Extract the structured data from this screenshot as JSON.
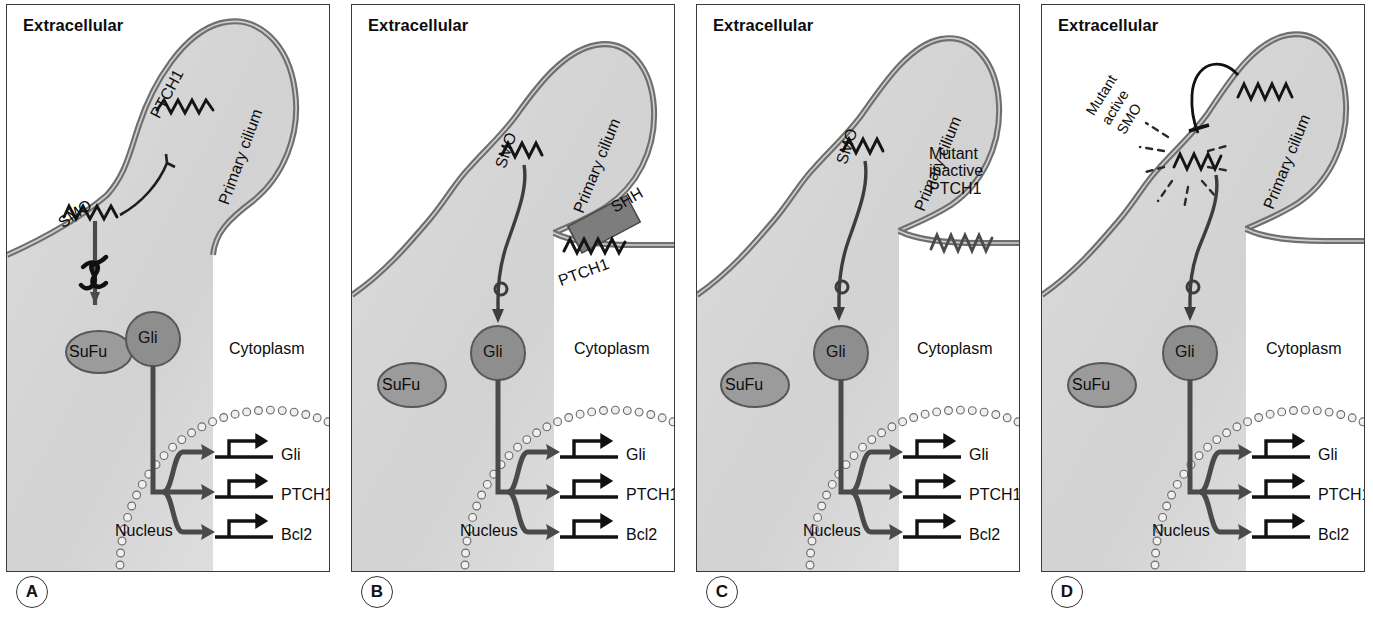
{
  "figure": {
    "colors": {
      "membrane": "#6f6f6f",
      "cytoplasm": "#d2d2d2",
      "nucleus_dark": "#8f8f8f",
      "gli_fill": "#8e8e8e",
      "sufu_fill": "#9b9b9b",
      "shh_fill": "#7d7d7d",
      "line": "#2b2b2b",
      "panel_border": "#3a3a3a"
    }
  },
  "panels": [
    {
      "letter": "A",
      "state": "inactive-pathway",
      "extracellular": "Extracellular",
      "cytoplasm": "Cytoplasm",
      "nucleus": "Nucleus",
      "cilium": "Primary cilium",
      "receptor": "PTCH1",
      "transducer": "SMO",
      "sufu": "SuFu",
      "gli": "Gli",
      "genes": [
        "Gli",
        "PTCH1",
        "Bcl2"
      ],
      "blocked": true,
      "sufu_bound": true,
      "ligand": null,
      "starburst": false
    },
    {
      "letter": "B",
      "state": "ligand-activated",
      "extracellular": "Extracellular",
      "cytoplasm": "Cytoplasm",
      "nucleus": "Nucleus",
      "cilium": "Primary cilium",
      "receptor": "PTCH1",
      "transducer": "SMO",
      "sufu": "SuFu",
      "gli": "Gli",
      "genes": [
        "Gli",
        "PTCH1",
        "Bcl2"
      ],
      "blocked": false,
      "sufu_bound": false,
      "ligand": "SHH",
      "starburst": false
    },
    {
      "letter": "C",
      "state": "mutant-inactive-ptch1",
      "extracellular": "Extracellular",
      "cytoplasm": "Cytoplasm",
      "nucleus": "Nucleus",
      "cilium": "Primary cilium",
      "receptor": "Mutant\ninactive\nPTCH1",
      "transducer": "SMO",
      "sufu": "SuFu",
      "gli": "Gli",
      "genes": [
        "Gli",
        "PTCH1",
        "Bcl2"
      ],
      "blocked": false,
      "sufu_bound": false,
      "ligand": null,
      "starburst": false
    },
    {
      "letter": "D",
      "state": "mutant-active-smo",
      "extracellular": "Extracellular",
      "cytoplasm": "Cytoplasm",
      "nucleus": "Nucleus",
      "cilium": "Primary cilium",
      "receptor": "",
      "transducer": "Mutant\nactive\nSMO",
      "sufu": "SuFu",
      "gli": "Gli",
      "genes": [
        "Gli",
        "PTCH1",
        "Bcl2"
      ],
      "blocked": false,
      "sufu_bound": false,
      "ligand": null,
      "starburst": true
    }
  ]
}
